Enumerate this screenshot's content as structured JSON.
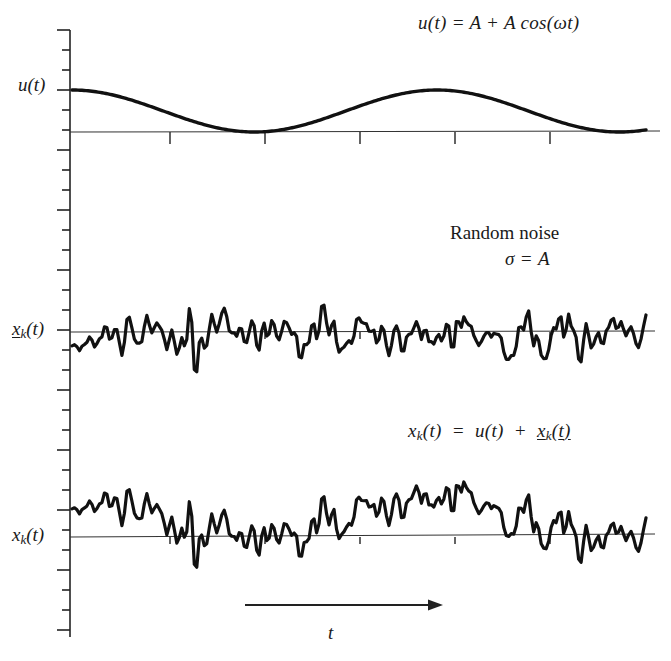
{
  "figure": {
    "background": "#ffffff",
    "ink": "#111111",
    "trace_color": "#111111",
    "axis_color": "#333333"
  },
  "annotations": {
    "equation_top": "u(t)  =  A  +  A cos(ωt)",
    "noise_title": "Random noise",
    "noise_sigma": "σ  =  A",
    "equation_bottom": "xₖ(t)  =  u(t)  +  xₖ(t)",
    "time_axis_label": "t"
  },
  "panels": [
    {
      "id": "panel-u",
      "ylabel": "u(t)",
      "description": "deterministic raised cosine signal",
      "baseline_y": 132
    },
    {
      "id": "panel-noise",
      "ylabel": "xₖ(t)",
      "ylabel_underlined": true,
      "description": "zero-mean random noise record",
      "baseline_y": 332
    },
    {
      "id": "panel-sum",
      "ylabel": "xₖ(t)",
      "ylabel_underlined": false,
      "description": "signal plus noise",
      "baseline_y": 537
    }
  ],
  "chart_data": {
    "type": "line",
    "title": "",
    "xlabel": "t",
    "ylabel": "",
    "grid": false,
    "legend": "none",
    "axis": {
      "vertical_axis_x": 70,
      "vertical_axis_top": 30,
      "vertical_axis_bottom": 637,
      "tick_spacing_px": 20,
      "trace_start_x": 72,
      "trace_end_x": 646,
      "x_tick_positions": [
        170,
        265,
        360,
        455,
        550
      ],
      "time_arrow": {
        "x_start": 245,
        "x_end": 435,
        "y": 605
      }
    },
    "series": [
      {
        "name": "u(t)",
        "panel": "panel-u",
        "type": "analytic",
        "formula": "A + A*cos(omega*t)",
        "amplitude_px": 21,
        "baseline_y": 132,
        "period_px": 365,
        "phase": 0,
        "comment": "starts at maximum, touches baseline at minima"
      },
      {
        "name": "noise",
        "panel": "panel-noise",
        "type": "random",
        "baseline_y": 332,
        "sigma_px": 20,
        "seed": 1779,
        "samples": 230,
        "smoothing": 1
      },
      {
        "name": "signal_plus_noise",
        "panel": "panel-sum",
        "type": "sum",
        "baseline_y": 537,
        "components": [
          "u(t)",
          "noise"
        ],
        "sigma_px": 20,
        "amplitude_px": 21,
        "seed": 1779,
        "samples": 230,
        "smoothing": 1
      }
    ]
  }
}
